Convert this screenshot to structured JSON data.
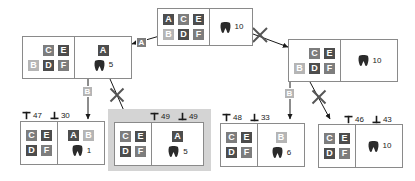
{
  "diagram": {
    "colors": {
      "tile_dark": "#4d4d4d",
      "tile_mid": "#7d7d7d",
      "tile_light": "#b5b5b5",
      "border": "#8a8a8a",
      "highlight": "#d4d4d4",
      "text": "#1a1a1a"
    },
    "icons": {
      "tooth": "tooth-icon",
      "upper_bound": "upper-bound-icon",
      "lower_bound": "lower-bound-icon",
      "cross": "cross-out-icon",
      "arrow": "arrow-icon"
    }
  },
  "nodes": {
    "root": {
      "name": "root-node",
      "rows": [
        [
          {
            "label": "A",
            "shade": "t-dark"
          },
          {
            "label": "C",
            "shade": "t-mid"
          },
          {
            "label": "E",
            "shade": "t-dark"
          }
        ],
        [
          {
            "label": "B",
            "shade": "t-light"
          },
          {
            "label": "D",
            "shade": "t-dark"
          },
          {
            "label": "F",
            "shade": "t-mid"
          }
        ]
      ],
      "assigned": [],
      "count": "10"
    },
    "left_child": {
      "name": "left-child-node",
      "rows": [
        [
          {
            "label": "",
            "shade": "blank"
          },
          {
            "label": "C",
            "shade": "t-mid"
          },
          {
            "label": "E",
            "shade": "t-dark"
          }
        ],
        [
          {
            "label": "B",
            "shade": "t-light"
          },
          {
            "label": "D",
            "shade": "t-dark"
          },
          {
            "label": "F",
            "shade": "t-mid"
          }
        ]
      ],
      "assigned": [
        {
          "label": "A",
          "shade": "t-dark"
        }
      ],
      "count": "5"
    },
    "right_child": {
      "name": "right-child-node",
      "rows": [
        [
          {
            "label": "",
            "shade": "blank"
          },
          {
            "label": "C",
            "shade": "t-mid"
          },
          {
            "label": "E",
            "shade": "t-dark"
          }
        ],
        [
          {
            "label": "B",
            "shade": "t-light"
          },
          {
            "label": "D",
            "shade": "t-dark"
          },
          {
            "label": "F",
            "shade": "t-mid"
          }
        ]
      ],
      "assigned": [],
      "count": "10"
    },
    "leaf1": {
      "name": "leaf-node-1",
      "upper": "47",
      "lower": "30",
      "rows": [
        [
          {
            "label": "C",
            "shade": "t-mid"
          },
          {
            "label": "E",
            "shade": "t-dark"
          }
        ],
        [
          {
            "label": "D",
            "shade": "t-dark"
          },
          {
            "label": "F",
            "shade": "t-mid"
          }
        ]
      ],
      "assigned": [
        {
          "label": "A",
          "shade": "t-dark"
        },
        {
          "label": "B",
          "shade": "t-light"
        }
      ],
      "count": "1"
    },
    "leaf2": {
      "name": "leaf-node-2",
      "upper": "49",
      "lower": "49",
      "rows": [
        [
          {
            "label": "C",
            "shade": "t-mid"
          },
          {
            "label": "E",
            "shade": "t-dark"
          }
        ],
        [
          {
            "label": "D",
            "shade": "t-dark"
          },
          {
            "label": "F",
            "shade": "t-mid"
          }
        ]
      ],
      "assigned": [
        {
          "label": "A",
          "shade": "t-dark"
        }
      ],
      "count": "5",
      "selected": true
    },
    "leaf3": {
      "name": "leaf-node-3",
      "upper": "48",
      "lower": "33",
      "rows": [
        [
          {
            "label": "C",
            "shade": "t-mid"
          },
          {
            "label": "E",
            "shade": "t-dark"
          }
        ],
        [
          {
            "label": "D",
            "shade": "t-dark"
          },
          {
            "label": "F",
            "shade": "t-mid"
          }
        ]
      ],
      "assigned": [
        {
          "label": "B",
          "shade": "t-light"
        }
      ],
      "count": "6"
    },
    "leaf4": {
      "name": "leaf-node-4",
      "upper": "46",
      "lower": "43",
      "rows": [
        [
          {
            "label": "C",
            "shade": "t-mid"
          },
          {
            "label": "E",
            "shade": "t-dark"
          }
        ],
        [
          {
            "label": "D",
            "shade": "t-dark"
          },
          {
            "label": "F",
            "shade": "t-mid"
          }
        ]
      ],
      "assigned": [],
      "count": "10"
    }
  },
  "edge_labels": {
    "root_to_left": "A",
    "left_to_leaf1": "B",
    "right_to_leaf3": "B"
  },
  "edge_marks": {
    "root_to_right": "cross",
    "left_to_leaf2": "cross",
    "right_to_leaf4": "cross"
  }
}
